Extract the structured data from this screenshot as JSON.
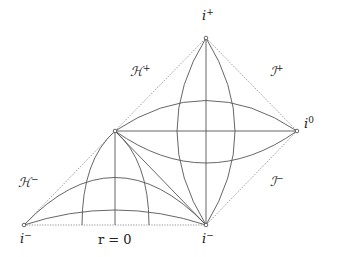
{
  "diagram": {
    "vertices": {
      "i_plus": {
        "x": 206,
        "y": 38,
        "label": "i",
        "sup": "+"
      },
      "i_zero": {
        "x": 297,
        "y": 131,
        "label": "i",
        "sup": "0"
      },
      "left_vertex": {
        "x": 115,
        "y": 131
      },
      "i_minus_left": {
        "x": 24,
        "y": 225,
        "label": "i",
        "sup": "−"
      },
      "i_minus_right": {
        "x": 206,
        "y": 225,
        "label": "i",
        "sup": "−"
      }
    },
    "boundary_labels": {
      "H_plus": {
        "text": "ℋ",
        "sup": "+"
      },
      "H_minus": {
        "text": "ℋ",
        "sup": "−"
      },
      "I_plus": {
        "text": "ℐ",
        "sup": "+"
      },
      "I_minus": {
        "text": "ℐ",
        "sup": "−"
      },
      "r_zero": "r = 0"
    },
    "dotted_paths": [
      "M115,131 L206,38",
      "M206,38 L297,131",
      "M297,131 L206,225",
      "M24,225 L115,131",
      "M24,225 L206,225"
    ],
    "solid_paths": [
      "M206,38 L206,225",
      "M115,131 L297,131",
      "M206,38 Q148,131 206,225",
      "M206,38 Q264,131 206,225",
      "M115,131 Q206,70 297,131",
      "M115,131 Q206,195 297,131",
      "M115,131 L206,225",
      "M115,131 L115,225",
      "M115,131 Q82,160 82,225",
      "M115,131 Q149,160 149,225",
      "M24,225 Q115,130 206,225",
      "M24,225 Q115,195 206,225"
    ]
  }
}
